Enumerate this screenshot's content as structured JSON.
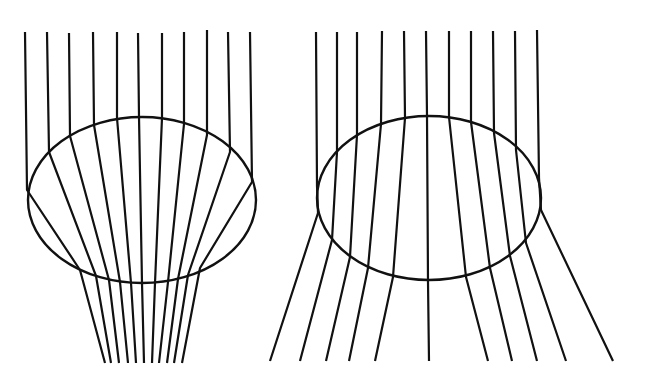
{
  "figure": {
    "width": 651,
    "height": 376,
    "background": "#ffffff",
    "stroke_color": "#111111"
  },
  "panels": [
    {
      "id": "converging",
      "description": "Parallel rays refracted by an ellipse converging downward",
      "ellipse": {
        "cx": 142,
        "cy": 200,
        "rx": 114,
        "ry": 83
      },
      "rays": [
        {
          "top": [
            25,
            32
          ],
          "entry": [
            27,
            190
          ],
          "exit": [
            80,
            270
          ],
          "bottom": [
            105,
            363
          ]
        },
        {
          "top": [
            47,
            32
          ],
          "entry": [
            49,
            152
          ],
          "exit": [
            96,
            276
          ],
          "bottom": [
            111,
            363
          ]
        },
        {
          "top": [
            69,
            33
          ],
          "entry": [
            70,
            136
          ],
          "exit": [
            109,
            280
          ],
          "bottom": [
            119,
            363
          ]
        },
        {
          "top": [
            93,
            32
          ],
          "entry": [
            94,
            125
          ],
          "exit": [
            120,
            282
          ],
          "bottom": [
            128,
            363
          ]
        },
        {
          "top": [
            117,
            32
          ],
          "entry": [
            117,
            118
          ],
          "exit": [
            131,
            283
          ],
          "bottom": [
            136,
            363
          ]
        },
        {
          "top": [
            138,
            33
          ],
          "entry": [
            139,
            117
          ],
          "exit": [
            142,
            283
          ],
          "bottom": [
            144,
            363
          ]
        },
        {
          "top": [
            162,
            33
          ],
          "entry": [
            162,
            118
          ],
          "exit": [
            155,
            283
          ],
          "bottom": [
            152,
            363
          ]
        },
        {
          "top": [
            184,
            32
          ],
          "entry": [
            184,
            124
          ],
          "exit": [
            168,
            282
          ],
          "bottom": [
            159,
            363
          ]
        },
        {
          "top": [
            207,
            30
          ],
          "entry": [
            207,
            135
          ],
          "exit": [
            178,
            279
          ],
          "bottom": [
            167,
            363
          ]
        },
        {
          "top": [
            228,
            32
          ],
          "entry": [
            230,
            152
          ],
          "exit": [
            188,
            275
          ],
          "bottom": [
            174,
            363
          ]
        },
        {
          "top": [
            250,
            32
          ],
          "entry": [
            252,
            182
          ],
          "exit": [
            200,
            268
          ],
          "bottom": [
            182,
            363
          ]
        }
      ]
    },
    {
      "id": "diverging",
      "description": "Parallel rays refracted by an ellipse diverging downward",
      "ellipse": {
        "cx": 429,
        "cy": 198,
        "rx": 112,
        "ry": 82
      },
      "rays": [
        {
          "top": [
            316,
            32
          ],
          "entry": [
            317,
            186
          ],
          "exit": [
            318,
            213
          ],
          "bottom": [
            270,
            361
          ]
        },
        {
          "top": [
            337,
            32
          ],
          "entry": [
            337,
            152
          ],
          "exit": [
            332,
            240
          ],
          "bottom": [
            300,
            361
          ]
        },
        {
          "top": [
            357,
            32
          ],
          "entry": [
            357,
            135
          ],
          "exit": [
            350,
            257
          ],
          "bottom": [
            326,
            361
          ]
        },
        {
          "top": [
            382,
            31
          ],
          "entry": [
            381,
            124
          ],
          "exit": [
            368,
            268
          ],
          "bottom": [
            349,
            361
          ]
        },
        {
          "top": [
            404,
            31
          ],
          "entry": [
            405,
            118
          ],
          "exit": [
            393,
            277
          ],
          "bottom": [
            375,
            361
          ]
        },
        {
          "top": [
            426,
            31
          ],
          "entry": [
            427,
            116
          ],
          "exit": [
            428,
            282
          ],
          "bottom": [
            429,
            361
          ]
        },
        {
          "top": [
            449,
            31
          ],
          "entry": [
            449,
            117
          ],
          "exit": [
            466,
            277
          ],
          "bottom": [
            488,
            361
          ]
        },
        {
          "top": [
            471,
            31
          ],
          "entry": [
            471,
            122
          ],
          "exit": [
            490,
            268
          ],
          "bottom": [
            512,
            361
          ]
        },
        {
          "top": [
            493,
            31
          ],
          "entry": [
            494,
            133
          ],
          "exit": [
            510,
            256
          ],
          "bottom": [
            537,
            361
          ]
        },
        {
          "top": [
            515,
            31
          ],
          "entry": [
            516,
            150
          ],
          "exit": [
            526,
            243
          ],
          "bottom": [
            566,
            361
          ]
        },
        {
          "top": [
            537,
            30
          ],
          "entry": [
            539,
            178
          ],
          "exit": [
            541,
            210
          ],
          "bottom": [
            613,
            361
          ]
        }
      ]
    }
  ]
}
